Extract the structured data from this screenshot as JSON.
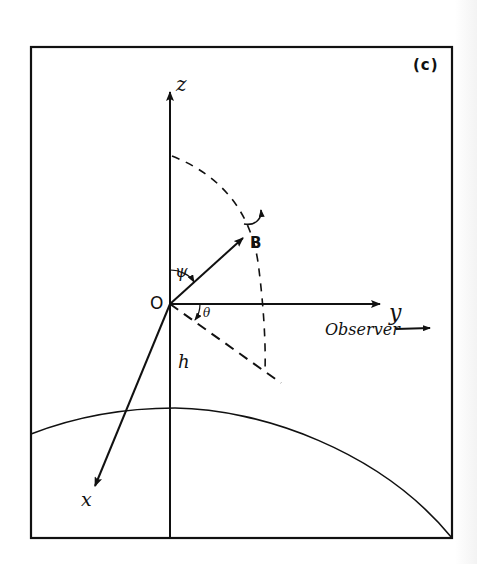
{
  "figure": {
    "panel_label": "(c)",
    "colors": {
      "ink": "#111111",
      "background": "#ffffff"
    },
    "axes": {
      "z": {
        "label": "z"
      },
      "y": {
        "label": "y"
      },
      "x": {
        "label": "x"
      }
    },
    "origin": {
      "label": "O"
    },
    "vector": {
      "label": "B"
    },
    "angles": {
      "psi": "ψ",
      "theta": "θ"
    },
    "line_labels": {
      "h": "h"
    },
    "observer": {
      "label": "Observer",
      "arrow": "→"
    }
  }
}
